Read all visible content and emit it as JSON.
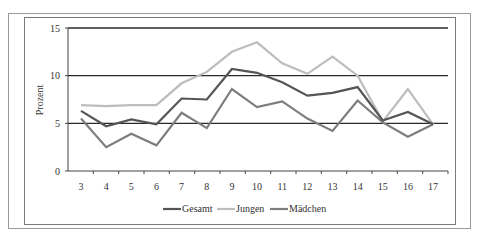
{
  "chart_data": {
    "type": "line",
    "title": "",
    "xlabel": "",
    "ylabel": "Prozent",
    "ylim": [
      0,
      15
    ],
    "yticks": [
      0,
      5,
      10,
      15
    ],
    "grid": "horizontal major gridlines at 5, 10, 15",
    "legend_position": "bottom",
    "x": [
      3,
      4,
      5,
      6,
      7,
      8,
      9,
      10,
      11,
      12,
      13,
      14,
      15,
      16,
      17
    ],
    "series": [
      {
        "name": "Gesamt",
        "color": "#555555",
        "values": [
          6.3,
          4.7,
          5.4,
          4.9,
          7.6,
          7.5,
          10.7,
          10.3,
          9.3,
          7.9,
          8.2,
          8.8,
          5.3,
          6.2,
          4.9
        ]
      },
      {
        "name": "Jungen",
        "color": "#bdbdbd",
        "values": [
          6.9,
          6.8,
          6.9,
          6.9,
          9.2,
          10.4,
          12.5,
          13.5,
          11.3,
          10.2,
          12.0,
          10.0,
          5.2,
          8.6,
          4.9
        ]
      },
      {
        "name": "Mädchen",
        "color": "#7d7d7d",
        "values": [
          5.5,
          2.5,
          3.9,
          2.7,
          6.1,
          4.5,
          8.6,
          6.7,
          7.3,
          5.5,
          4.2,
          7.4,
          5.1,
          3.6,
          4.9
        ]
      }
    ]
  },
  "axis": {
    "ylabel": "Prozent",
    "yticks": [
      "0",
      "5",
      "10",
      "15"
    ],
    "xticks": [
      "3",
      "4",
      "5",
      "6",
      "7",
      "8",
      "9",
      "10",
      "11",
      "12",
      "13",
      "14",
      "15",
      "16",
      "17"
    ]
  },
  "legend": [
    {
      "label": "Gesamt",
      "color": "#555555"
    },
    {
      "label": "Jungen",
      "color": "#bdbdbd"
    },
    {
      "label": "Mädchen",
      "color": "#7d7d7d"
    }
  ]
}
